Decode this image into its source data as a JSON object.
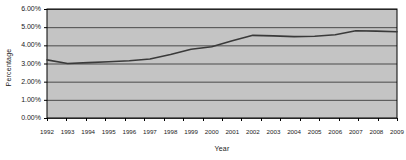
{
  "chart_data": {
    "type": "line",
    "title": "",
    "xlabel": "Year",
    "ylabel": "Percentage",
    "grid": true,
    "legend": "none",
    "categories": [
      "1992",
      "1993",
      "1994",
      "1995",
      "1996",
      "1997",
      "1998",
      "1999",
      "2000",
      "2001",
      "2002",
      "2003",
      "2004",
      "2005",
      "2006",
      "2007",
      "2008",
      "2009"
    ],
    "x": [
      1992,
      1993,
      1994,
      1995,
      1996,
      1997,
      1998,
      1999,
      2000,
      2001,
      2002,
      2003,
      2004,
      2005,
      2006,
      2007,
      2008,
      2009
    ],
    "values": [
      3.2,
      3.0,
      3.05,
      3.1,
      3.15,
      3.25,
      3.5,
      3.78,
      3.92,
      4.25,
      4.55,
      4.52,
      4.48,
      4.5,
      4.58,
      4.8,
      4.78,
      4.75
    ],
    "values_display": [
      "3.20%",
      "3.00%",
      "3.05%",
      "3.10%",
      "3.15%",
      "3.25%",
      "3.50%",
      "3.78%",
      "3.92%",
      "4.25%",
      "4.55%",
      "4.52%",
      "4.48%",
      "4.50%",
      "4.58%",
      "4.80%",
      "4.78%",
      "4.75%"
    ],
    "ylim": [
      0,
      6
    ],
    "ytick_values": [
      6,
      5,
      4,
      3,
      2,
      1,
      0
    ],
    "ytick_labels": [
      "6.00%",
      "5.00%",
      "4.00%",
      "3.00%",
      "2.00%",
      "1.00%",
      "0.00%"
    ],
    "xlim": [
      1992,
      2009
    ],
    "series_name": "Percentage",
    "colors": {
      "plot_background": "#c4c4c4",
      "plot_border": "#000000",
      "gridline": "#4a4a4a",
      "series_line": "#3a3a3a",
      "text": "#1a1a1a",
      "page_background": "#ffffff"
    }
  }
}
